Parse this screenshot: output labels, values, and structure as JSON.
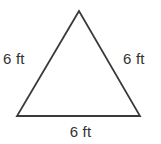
{
  "figure": {
    "name": "equilateral-triangle",
    "shape": "triangle",
    "stroke_color": "#3a3a3a",
    "fill_color": "#ffffff",
    "background_color": "#ffffff",
    "text_color": "#333333",
    "labels": {
      "left": "6 ft",
      "right": "6 ft",
      "bottom": "6 ft"
    }
  },
  "chart_data": {
    "type": "diagram",
    "title": "",
    "shape": "triangle",
    "unit": "ft",
    "sides": [
      {
        "position": "left",
        "length": 6,
        "label": "6 ft"
      },
      {
        "position": "right",
        "length": 6,
        "label": "6 ft"
      },
      {
        "position": "bottom",
        "length": 6,
        "label": "6 ft"
      }
    ],
    "vertices": [
      {
        "name": "apex",
        "x": 79,
        "y": 11
      },
      {
        "name": "bottom-left",
        "x": 17,
        "y": 116
      },
      {
        "name": "bottom-right",
        "x": 140,
        "y": 116
      }
    ],
    "annotations": [
      "6 ft",
      "6 ft",
      "6 ft"
    ]
  }
}
